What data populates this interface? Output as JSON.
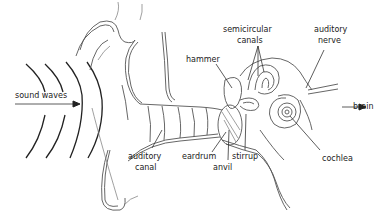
{
  "diagram": {
    "labels": {
      "sound_waves": "sound waves",
      "semicircular_canals_1": "semicircular",
      "semicircular_canals_2": "canals",
      "auditory_nerve_1": "auditory",
      "auditory_nerve_2": "nerve",
      "hammer": "hammer",
      "brain": "brain",
      "auditory_canal_1": "auditory",
      "auditory_canal_2": "canal",
      "eardrum": "eardrum",
      "stirrup": "stirrup",
      "anvil": "anvil",
      "cochlea": "cochlea"
    },
    "colors": {
      "line": "#555555",
      "text": "#222222",
      "background": "#ffffff"
    }
  }
}
